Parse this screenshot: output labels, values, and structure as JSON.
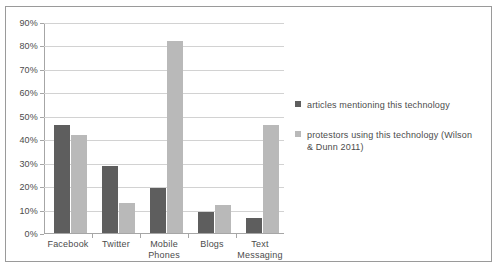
{
  "chart_data": {
    "type": "bar",
    "title": "",
    "subtitle": "",
    "xlabel": "",
    "ylabel": "",
    "grid": true,
    "legend_position": "right",
    "ylim": [
      0,
      90
    ],
    "ytick_labels": [
      "90%",
      "80%",
      "70%",
      "60%",
      "50%",
      "40%",
      "30%",
      "20%",
      "10%",
      "0%"
    ],
    "ytick_values": [
      90,
      80,
      70,
      60,
      50,
      40,
      30,
      20,
      10,
      0
    ],
    "categories": [
      "Facebook",
      "Twitter",
      "Mobile Phones",
      "Blogs",
      "Text Messaging"
    ],
    "series": [
      {
        "name": "articles mentioning this technology",
        "color": "#5e5e5e",
        "values": [
          46,
          28.5,
          19,
          9,
          6.5
        ]
      },
      {
        "name": "protestors using this technology (Wilson & Dunn 2011)",
        "color": "#b9b9b9",
        "values": [
          42,
          13,
          82,
          12,
          46
        ]
      }
    ]
  },
  "legend": {
    "items": [
      {
        "label": "articles mentioning this technology",
        "swatch_name": "legend-swatch-articles"
      },
      {
        "label": "protestors using this technology (Wilson & Dunn 2011)",
        "swatch_name": "legend-swatch-protestors"
      }
    ]
  },
  "colors": {
    "series_a": "#5e5e5e",
    "series_b": "#b9b9b9",
    "gridline": "#d2d2d2",
    "axis": "#a6a6a6",
    "frame": "#9a9a9a",
    "text": "#4c4c4c"
  }
}
